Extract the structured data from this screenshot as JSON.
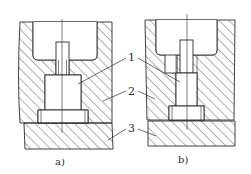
{
  "figure": {
    "panels": [
      {
        "id": "a",
        "caption": "a)"
      },
      {
        "id": "b",
        "caption": "b)"
      }
    ],
    "callouts": [
      {
        "number": "1"
      },
      {
        "number": "2"
      },
      {
        "number": "3"
      }
    ]
  },
  "colors": {
    "line": "#2a2a2a",
    "background": "#ffffff"
  }
}
